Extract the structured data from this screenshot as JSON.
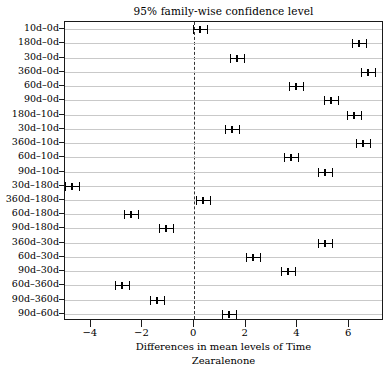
{
  "chart_data": {
    "type": "scatter",
    "title": "95% family-wise confidence level",
    "xlabel": "Differences in mean levels of Time",
    "sublabel": "Zearalenone",
    "ylabel": "",
    "xlim": [
      -5.0,
      7.35
    ],
    "xticks": [
      -4,
      -2,
      0,
      2,
      4,
      6
    ],
    "xtick_labels": [
      "-4",
      "-2",
      "0",
      "2",
      "4",
      "6"
    ],
    "grid": true,
    "reference_line": 0,
    "categories": [
      "10d-0d",
      "180d-0d",
      "30d-0d",
      "360d-0d",
      "60d-0d",
      "90d-0d",
      "180d-10d",
      "30d-10d",
      "360d-10d",
      "60d-10d",
      "90d-10d",
      "30d-180d",
      "360d-180d",
      "60d-180d",
      "90d-180d",
      "360d-30d",
      "60d-30d",
      "90d-30d",
      "60d-360d",
      "90d-360d",
      "90d-60d"
    ],
    "series": [
      {
        "name": "Tukey HSD difference",
        "points": [
          {
            "category": "10d-0d",
            "diff": 0.21,
            "lower": -0.06,
            "upper": 0.48
          },
          {
            "category": "180d-0d",
            "diff": 6.39,
            "lower": 6.11,
            "upper": 6.66
          },
          {
            "category": "30d-0d",
            "diff": 1.67,
            "lower": 1.4,
            "upper": 1.94
          },
          {
            "category": "360d-0d",
            "diff": 6.74,
            "lower": 6.47,
            "upper": 7.01
          },
          {
            "category": "60d-0d",
            "diff": 3.95,
            "lower": 3.68,
            "upper": 4.22
          },
          {
            "category": "90d-0d",
            "diff": 5.29,
            "lower": 5.02,
            "upper": 5.56
          },
          {
            "category": "180d-10d",
            "diff": 6.18,
            "lower": 5.91,
            "upper": 6.45
          },
          {
            "category": "30d-10d",
            "diff": 1.46,
            "lower": 1.19,
            "upper": 1.73
          },
          {
            "category": "360d-10d",
            "diff": 6.53,
            "lower": 6.26,
            "upper": 6.8
          },
          {
            "category": "60d-10d",
            "diff": 3.74,
            "lower": 3.47,
            "upper": 4.01
          },
          {
            "category": "90d-10d",
            "diff": 5.08,
            "lower": 4.81,
            "upper": 5.35
          },
          {
            "category": "30d-180d",
            "diff": -4.72,
            "lower": -4.99,
            "upper": -4.45
          },
          {
            "category": "360d-180d",
            "diff": 0.35,
            "lower": 0.08,
            "upper": 0.62
          },
          {
            "category": "60d-180d",
            "diff": -2.44,
            "lower": -2.71,
            "upper": -2.17
          },
          {
            "category": "90d-180d",
            "diff": -1.1,
            "lower": -1.37,
            "upper": -0.83
          },
          {
            "category": "360d-30d",
            "diff": 5.07,
            "lower": 4.8,
            "upper": 5.34
          },
          {
            "category": "60d-30d",
            "diff": 2.28,
            "lower": 2.01,
            "upper": 2.55
          },
          {
            "category": "90d-30d",
            "diff": 3.62,
            "lower": 3.35,
            "upper": 3.89
          },
          {
            "category": "60d-360d",
            "diff": -2.79,
            "lower": -3.06,
            "upper": -2.52
          },
          {
            "category": "90d-360d",
            "diff": -1.45,
            "lower": -1.72,
            "upper": -1.18
          },
          {
            "category": "90d-60d",
            "diff": 1.34,
            "lower": 1.07,
            "upper": 1.61
          }
        ]
      }
    ]
  }
}
